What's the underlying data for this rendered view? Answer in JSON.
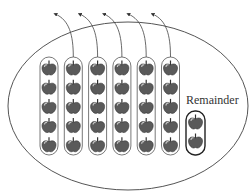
{
  "diagram": {
    "group_size": 5,
    "group_count": 6,
    "groups_removed": 5,
    "remainder_count": 2,
    "remainder_label": "Remainder",
    "colors": {
      "stroke": "#555555",
      "apple_fill": "#5a5a5a",
      "apple_highlight": "#bbbbbb",
      "background": "#ffffff"
    }
  }
}
